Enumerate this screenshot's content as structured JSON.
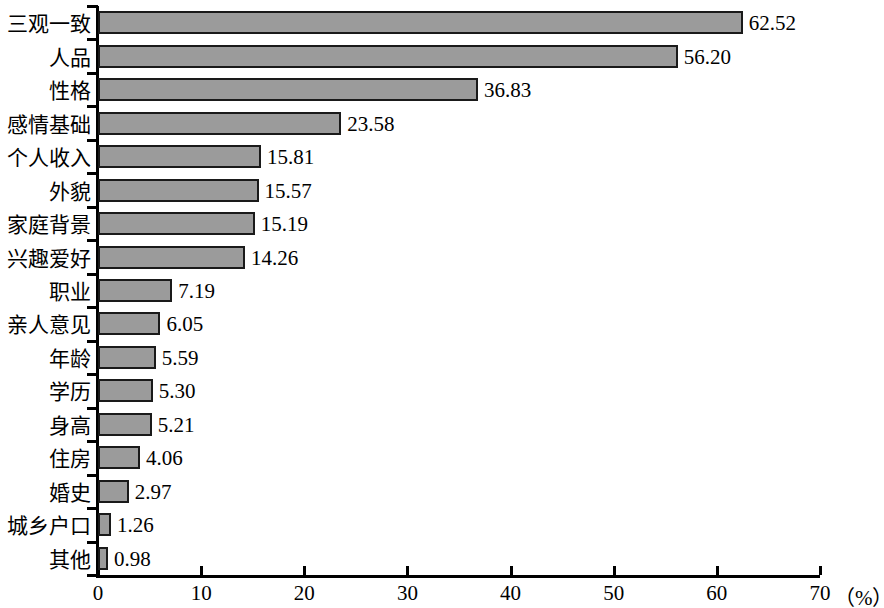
{
  "chart_data": {
    "type": "bar",
    "orientation": "horizontal",
    "title": "",
    "xlabel": "（%）",
    "ylabel": "",
    "xlim": [
      0,
      70
    ],
    "xticks": [
      0,
      10,
      20,
      30,
      40,
      50,
      60,
      70
    ],
    "xtick_labels": [
      "0",
      "10",
      "20",
      "30",
      "40",
      "50",
      "60",
      "70"
    ],
    "grid": false,
    "legend": false,
    "bar_fill_color": "#9b9b9b",
    "bar_edge_color": "#1a1a1a",
    "axis_color": "#000000",
    "categories": [
      "三观一致",
      "人品",
      "性格",
      "感情基础",
      "个人收入",
      "外貌",
      "家庭背景",
      "兴趣爱好",
      "职业",
      "亲人意见",
      "年龄",
      "学历",
      "身高",
      "住房",
      "婚史",
      "城乡户口",
      "其他"
    ],
    "values": [
      62.52,
      56.2,
      36.83,
      23.58,
      15.81,
      15.57,
      15.19,
      14.26,
      7.19,
      6.05,
      5.59,
      5.3,
      5.21,
      4.06,
      2.97,
      1.26,
      0.98
    ],
    "value_labels": [
      "62.52",
      "56.20",
      "36.83",
      "23.58",
      "15.81",
      "15.57",
      "15.19",
      "14.26",
      "7.19",
      "6.05",
      "5.59",
      "5.30",
      "5.21",
      "4.06",
      "2.97",
      "1.26",
      "0.98"
    ]
  }
}
